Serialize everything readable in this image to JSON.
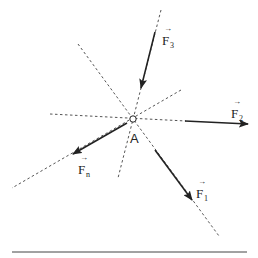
{
  "diagram": {
    "title": "",
    "point": {
      "label": "A",
      "x": 133,
      "y": 119
    },
    "forces": [
      {
        "id": "F1",
        "label": "F",
        "subscript": "1"
      },
      {
        "id": "F2",
        "label": "F",
        "subscript": "2"
      },
      {
        "id": "F3",
        "label": "F",
        "subscript": "3"
      },
      {
        "id": "Fn",
        "label": "F",
        "subscript": "n"
      }
    ],
    "colors": {
      "line": "#222222",
      "dashed": "#555555",
      "background": "#ffffff"
    }
  }
}
